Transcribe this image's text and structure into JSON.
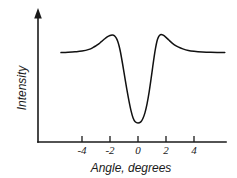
{
  "chart_data": {
    "type": "line",
    "title": "",
    "xlabel": "Angle, degrees",
    "ylabel": "Intensity",
    "xticklabels": [
      "-4",
      "-2",
      "0",
      "2",
      "4"
    ],
    "xticks": [
      -4,
      -2,
      0,
      2,
      4
    ],
    "xlim": [
      -5.5,
      6.2
    ],
    "ylim": [
      0,
      1.15
    ],
    "yticklabels": [],
    "grid": false,
    "legend": null,
    "line_color": "#111111",
    "axis_color": "#1a1a1a",
    "background": "#ffffff",
    "series": [
      {
        "name": "Intensity",
        "x": [
          -5.5,
          -5.0,
          -4.5,
          -4.0,
          -3.5,
          -3.2,
          -3.0,
          -2.8,
          -2.6,
          -2.4,
          -2.2,
          -2.0,
          -1.85,
          -1.75,
          -1.65,
          -1.55,
          -1.45,
          -1.35,
          -1.25,
          -1.1,
          -0.95,
          -0.8,
          -0.65,
          -0.5,
          -0.35,
          -0.2,
          0.0,
          0.2,
          0.35,
          0.5,
          0.65,
          0.8,
          0.95,
          1.05,
          1.15,
          1.25,
          1.35,
          1.45,
          1.55,
          1.65,
          1.8,
          2.0,
          2.2,
          2.4,
          2.6,
          2.9,
          3.2,
          3.6,
          4.0,
          4.6,
          5.2,
          6.2
        ],
        "y": [
          0.745,
          0.748,
          0.752,
          0.758,
          0.772,
          0.788,
          0.802,
          0.818,
          0.838,
          0.858,
          0.876,
          0.888,
          0.892,
          0.89,
          0.882,
          0.866,
          0.84,
          0.8,
          0.748,
          0.65,
          0.545,
          0.44,
          0.345,
          0.262,
          0.2,
          0.168,
          0.158,
          0.168,
          0.196,
          0.245,
          0.32,
          0.42,
          0.54,
          0.625,
          0.708,
          0.78,
          0.838,
          0.872,
          0.89,
          0.896,
          0.89,
          0.872,
          0.85,
          0.828,
          0.81,
          0.79,
          0.776,
          0.763,
          0.756,
          0.75,
          0.747,
          0.745
        ]
      }
    ]
  },
  "axes": {
    "y_arrow": "arrow-up-icon",
    "x_axis_name": "x-axis",
    "y_axis_name": "y-axis"
  }
}
